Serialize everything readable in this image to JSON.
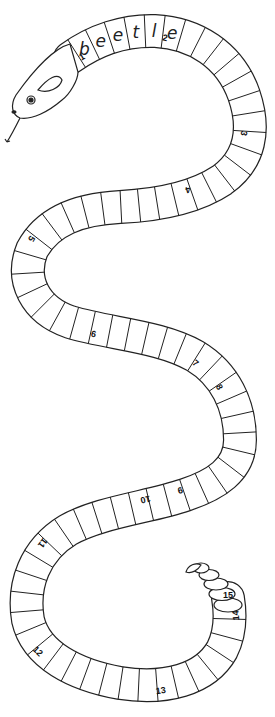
{
  "puzzle": {
    "type": "word snake",
    "filled_word": "beetle",
    "letters": [
      "b",
      "e",
      "e",
      "t",
      "l",
      "e"
    ],
    "clue_numbers": [
      "1",
      "2",
      "3",
      "4",
      "5",
      "6",
      "7",
      "8",
      "9",
      "10",
      "11",
      "12",
      "13",
      "14",
      "15"
    ]
  },
  "colors": {
    "line": "#222222",
    "background": "#ffffff"
  },
  "icons": {
    "head": "snake-head-icon",
    "tail": "rattle-icon"
  }
}
